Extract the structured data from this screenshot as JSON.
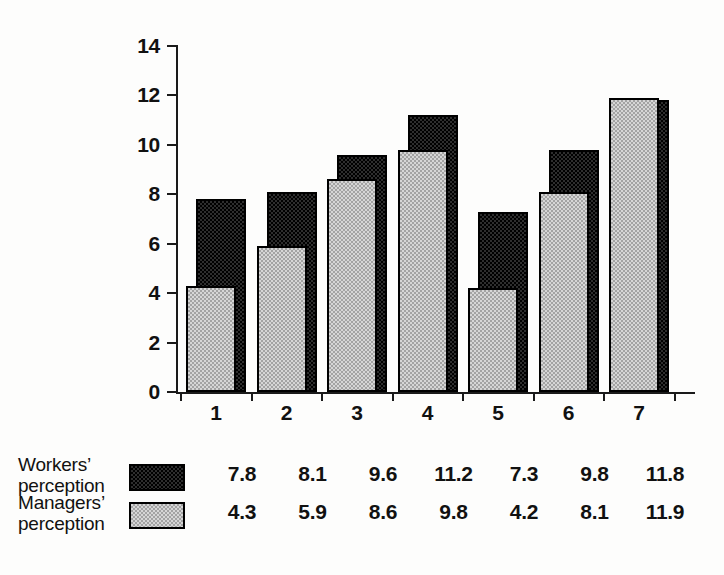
{
  "chart_data": {
    "type": "bar",
    "title": "",
    "subtitle": "",
    "xlabel": "",
    "ylabel": "",
    "categories": [
      "1",
      "2",
      "3",
      "4",
      "5",
      "6",
      "7"
    ],
    "ylim": [
      0,
      14
    ],
    "yticks": [
      0,
      2,
      4,
      6,
      8,
      10,
      12,
      14
    ],
    "ytick_labels": [
      "0",
      "2",
      "4",
      "6",
      "8",
      "10",
      "12",
      "14"
    ],
    "grid": false,
    "legend_position": "bottom-left",
    "series": [
      {
        "name": "Workers’ perception",
        "swatch": "dark-checker",
        "color": "#2e2e2e",
        "values": [
          7.8,
          8.1,
          9.6,
          11.2,
          7.3,
          9.8,
          11.8
        ],
        "value_labels": [
          "7.8",
          "8.1",
          "9.6",
          "11.2",
          "7.3",
          "9.8",
          "11.8"
        ]
      },
      {
        "name": "Managers’ perception",
        "swatch": "light-checker",
        "color": "#d6d6d6",
        "values": [
          4.3,
          5.9,
          8.6,
          9.8,
          4.2,
          8.1,
          11.9
        ],
        "value_labels": [
          "4.3",
          "5.9",
          "8.6",
          "9.8",
          "4.2",
          "8.1",
          "11.9"
        ]
      }
    ]
  },
  "legend": {
    "workers": {
      "line1": "Workers’",
      "line2": "perception"
    },
    "managers": {
      "line1": "Managers’",
      "line2": "perception"
    }
  },
  "colors": {
    "axis": "#1a1a1a",
    "text": "#111111",
    "background": "#fdfdfc",
    "dark_series": "#2e2e2e",
    "light_series": "#d6d6d6"
  }
}
